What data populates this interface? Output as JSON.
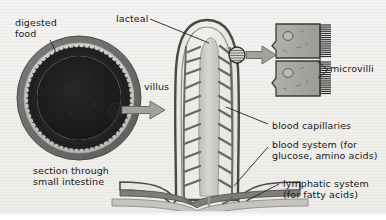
{
  "figure": {
    "background_color": "#f3f1ee",
    "ink_color": "#16181a"
  },
  "labels": {
    "digested_food": "digested\nfood",
    "section_through": "section through\nsmall intestine",
    "lacteal": "lacteal",
    "villus": "villus",
    "microvilli": "microvilli",
    "blood_capillaries": "blood capillaries",
    "blood_system": "blood system (for\nglucose, amino acids)",
    "lymphatic_system": "lymphatic system\n(for fatty acids)"
  },
  "colors": {
    "lumen_dark": "#1d1d1d",
    "villi_ring": "#2a2a2a",
    "submucosa_light": "#c9c7c4",
    "muscle_outer": "#6e6c6a",
    "vessel_gray": "#8f8d8b",
    "lacteal_fill": "#cfcdca",
    "cell_fill": "#a7a5a2",
    "arrow_gray": "#9a9895",
    "outline": "#3a3a3a"
  },
  "structures": {
    "cross_section": {
      "name": "section through small intestine",
      "layers": [
        "lumen with digested food",
        "villi fringe",
        "submucosa",
        "muscle layer"
      ]
    },
    "villus": {
      "name": "villus",
      "contains": [
        "lacteal",
        "blood capillaries"
      ]
    },
    "magnified_cells": {
      "name": "epithelial cells with microvilli",
      "cell_count": 2
    },
    "base_vessels": {
      "upper_band": "blood system",
      "lower_band": "lymphatic system"
    }
  }
}
